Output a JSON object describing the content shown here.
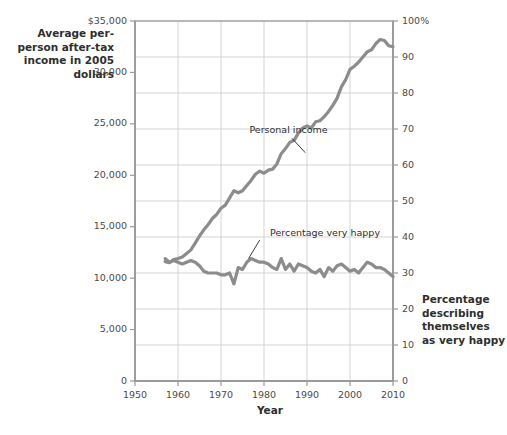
{
  "chart_data": {
    "type": "line",
    "title": "",
    "xlabel": "Year",
    "ylabel": "Average per-person after-tax income in 2005 dollars",
    "y2label": "Percentage describing themselves as very happy",
    "xlim": [
      1950,
      2010
    ],
    "ylim": [
      0,
      35000
    ],
    "y2lim": [
      0,
      100
    ],
    "grid": true,
    "legend_position": "inline-annotations",
    "xticks": [
      "1950",
      "1960",
      "1970",
      "1980",
      "1990",
      "2000",
      "2010"
    ],
    "xtick_values": [
      1950,
      1960,
      1970,
      1980,
      1990,
      2000,
      2010
    ],
    "yticks_left": [
      "$35,000",
      "30,000",
      "25,000",
      "20,000",
      "15,000",
      "10,000",
      "5,000",
      "0"
    ],
    "ytick_left_values": [
      35000,
      30000,
      25000,
      20000,
      15000,
      10000,
      5000,
      0
    ],
    "yticks_right": [
      "100%",
      "90",
      "80",
      "70",
      "60",
      "50",
      "40",
      "30",
      "20",
      "10",
      "0"
    ],
    "ytick_right_values": [
      100,
      90,
      80,
      70,
      60,
      50,
      40,
      30,
      20,
      10,
      0
    ],
    "line_color": "#8c8c8c",
    "grid_color": "#cfcfcf",
    "border_color": "#b3b3b3",
    "series": [
      {
        "name": "Personal income",
        "axis": "left",
        "units": "2005 dollars",
        "x": [
          1957,
          1958,
          1959,
          1960,
          1961,
          1962,
          1963,
          1964,
          1965,
          1966,
          1967,
          1968,
          1969,
          1970,
          1971,
          1972,
          1973,
          1974,
          1975,
          1976,
          1977,
          1978,
          1979,
          1980,
          1981,
          1982,
          1983,
          1984,
          1985,
          1986,
          1987,
          1988,
          1989,
          1990,
          1991,
          1992,
          1993,
          1994,
          1995,
          1996,
          1997,
          1998,
          1999,
          2000,
          2001,
          2002,
          2003,
          2004,
          2005,
          2006,
          2007,
          2008,
          2009,
          2010
        ],
        "values": [
          11600,
          11500,
          11800,
          11900,
          12050,
          12400,
          12750,
          13400,
          14100,
          14700,
          15200,
          15800,
          16200,
          16800,
          17100,
          17800,
          18500,
          18300,
          18500,
          19000,
          19500,
          20100,
          20400,
          20200,
          20500,
          20600,
          21100,
          22100,
          22600,
          23200,
          23400,
          24100,
          24600,
          24800,
          24600,
          25200,
          25300,
          25700,
          26200,
          26800,
          27500,
          28600,
          29300,
          30300,
          30600,
          31000,
          31500,
          32000,
          32200,
          32800,
          33200,
          33100,
          32600,
          32500
        ]
      },
      {
        "name": "Percentage very happy",
        "axis": "right",
        "units": "percent",
        "x": [
          1957,
          1958,
          1959,
          1960,
          1961,
          1962,
          1963,
          1964,
          1965,
          1966,
          1967,
          1968,
          1969,
          1970,
          1971,
          1972,
          1973,
          1974,
          1975,
          1976,
          1977,
          1978,
          1979,
          1980,
          1981,
          1982,
          1983,
          1984,
          1985,
          1986,
          1987,
          1988,
          1989,
          1990,
          1991,
          1992,
          1993,
          1994,
          1995,
          1996,
          1997,
          1998,
          1999,
          2000,
          2001,
          2002,
          2003,
          2004,
          2005,
          2006,
          2007,
          2008,
          2009,
          2010
        ],
        "values": [
          34,
          33,
          33.5,
          33,
          32.5,
          33,
          33.5,
          33,
          32,
          30.5,
          30,
          30,
          30,
          29.5,
          29.5,
          30,
          27,
          31.5,
          31,
          33,
          34,
          33.5,
          33,
          33,
          32.5,
          31.5,
          31,
          34,
          31,
          32.5,
          30.5,
          32.5,
          32,
          31.5,
          30.5,
          30,
          31,
          29,
          31.5,
          30.5,
          32,
          32.5,
          31.5,
          30.5,
          31,
          30,
          31.5,
          33,
          32.5,
          31.5,
          31.5,
          31,
          30,
          29
        ]
      }
    ],
    "annotations": [
      {
        "text": "Personal income",
        "x": 1978,
        "y_label": 24300,
        "axis": "left"
      },
      {
        "text": "Percentage very happy",
        "x": 1984,
        "y_label": 14300,
        "axis": "left"
      }
    ]
  },
  "labels": {
    "left_axis_title": "Average per-person after-tax income in 2005 dollars",
    "right_axis_title": "Percentage describing themselves as very happy",
    "x_axis_title": "Year",
    "series_personal_income": "Personal income",
    "series_percentage_very_happy": "Percentage very happy"
  }
}
